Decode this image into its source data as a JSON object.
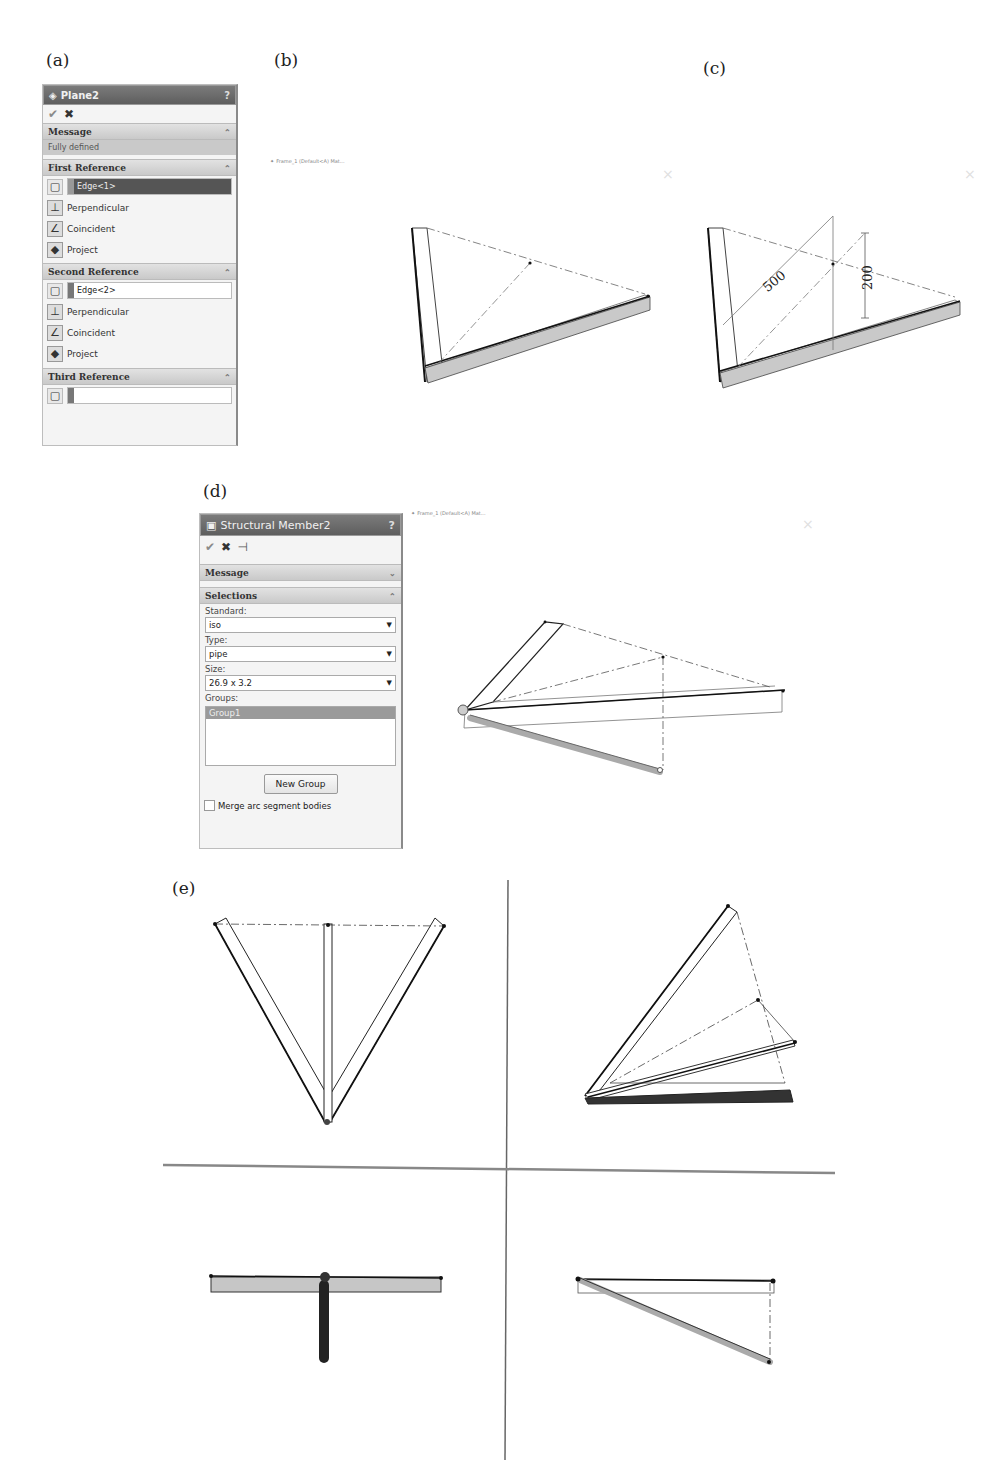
{
  "figure_labels": {
    "a": "(a)",
    "b": "(b)",
    "c": "(c)",
    "d": "(d)",
    "e": "(e)"
  },
  "panel_a": {
    "title": "Plane2",
    "title_icon": "plane-icon",
    "help": "?",
    "actions": {
      "ok": "✔",
      "cancel": "✖"
    },
    "message": {
      "header": "Message",
      "text": "Fully defined"
    },
    "first_reference": {
      "header": "First Reference",
      "value": "Edge<1>",
      "options": [
        "Perpendicular",
        "Coincident",
        "Project"
      ]
    },
    "second_reference": {
      "header": "Second Reference",
      "value": "Edge<2>",
      "options": [
        "Perpendicular",
        "Coincident",
        "Project"
      ]
    },
    "third_reference": {
      "header": "Third Reference",
      "value": ""
    }
  },
  "view_b": {
    "tree_item": "Frame_1 (Default<A) Mat..."
  },
  "view_c": {
    "dimension_1": "500",
    "dimension_2": "200"
  },
  "panel_d": {
    "title": "Structural Member2",
    "title_icon": "structural-member-icon",
    "help": "?",
    "actions": {
      "ok": "✔",
      "cancel": "✖",
      "pin": "⊣"
    },
    "message": {
      "header": "Message"
    },
    "selections": {
      "header": "Selections",
      "standard_label": "Standard:",
      "standard_value": "iso",
      "type_label": "Type:",
      "type_value": "pipe",
      "size_label": "Size:",
      "size_value": "26.9 x 3.2",
      "groups_label": "Groups:",
      "groups": [
        "Group1"
      ],
      "new_group_button": "New Group",
      "merge_checkbox": "Merge arc segment bodies",
      "merge_checked": false
    }
  },
  "view_d": {
    "tree_item": "Frame_1 (Default<A) Mat..."
  },
  "colors": {
    "title_bar": "#6b6b6b",
    "section_header": "#d4d4d4",
    "highlight": "#555555",
    "member_fill": "#d0d0d0"
  }
}
